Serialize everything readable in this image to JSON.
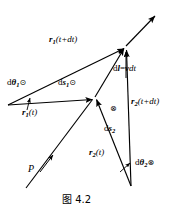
{
  "figure": {
    "caption": "图 4.2",
    "background_color": "#ffffff",
    "stroke_color": "#000000",
    "width": 173,
    "height": 210,
    "labels": {
      "r1_t_plus_dt": "r₁(t+dt)",
      "dtheta1": "dθ₁⊙",
      "ds1": "ds₁⊙",
      "r1_t": "r₁(t)",
      "dl_eq_vdt": "dl=vdt",
      "r2_t_plus_dt": "r₂(t+dt)",
      "cross_middle": "⊗",
      "ds2": "ds₂",
      "r2_t": "r₂(t)",
      "dtheta2": "dθ₂⊗",
      "point_p": "P"
    },
    "label_parts": {
      "r1_t_plus_dt": {
        "vec": "r",
        "sub": "1",
        "rest": "(t+dt)"
      },
      "dtheta1": {
        "d": "d",
        "theta": "θ",
        "sub": "1",
        "marker": "⊙"
      },
      "ds1": {
        "d": "d",
        "vec": "s",
        "sub": "1",
        "marker": "⊙"
      },
      "r1_t": {
        "vec": "r",
        "sub": "1",
        "rest": "(t)"
      },
      "dl_eq_vdt": {
        "d": "d",
        "vec_l": "l",
        "eq": "=",
        "vec_v": "v",
        "dt": "dt"
      },
      "r2_t_plus_dt": {
        "vec": "r",
        "sub": "2",
        "rest": "(t+dt)"
      },
      "ds2": {
        "d": "d",
        "vec": "s",
        "sub": "2"
      },
      "r2_t": {
        "vec": "r",
        "sub": "2",
        "rest": "(t)"
      },
      "dtheta2": {
        "d": "d",
        "theta": "θ",
        "sub": "2",
        "marker": "⊗"
      },
      "point_p": {
        "text": "P"
      }
    },
    "geometry": {
      "vertex_left": [
        8,
        105
      ],
      "vertex_mid": [
        95,
        97
      ],
      "vertex_top": [
        126,
        46
      ],
      "vertex_bottom": [
        131,
        186
      ],
      "ray_top_end": [
        156,
        14
      ],
      "vertical_x": 126
    }
  }
}
